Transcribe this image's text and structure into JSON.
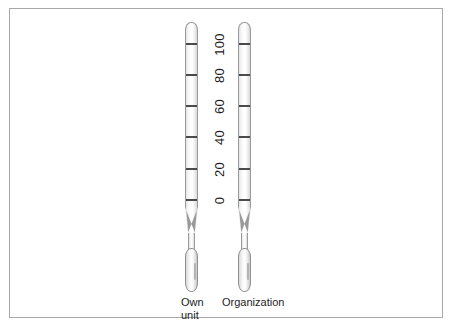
{
  "figure": {
    "background_color": "#ffffff",
    "frame_color": "#a8a8a8",
    "tick_color": "#4a4a4a",
    "text_color": "#1d1d1d"
  },
  "scale": {
    "labels": [
      "100",
      "80",
      "60",
      "40",
      "20",
      "0"
    ],
    "values": [
      100,
      80,
      60,
      40,
      20,
      0
    ],
    "tick_count": 6,
    "orientation": "vertical",
    "label_rotation_deg": -90
  },
  "thermometers": [
    {
      "id": "own-unit",
      "caption": "Own\nunit",
      "caption_line1": "Own",
      "caption_line2": "unit"
    },
    {
      "id": "organization",
      "caption": "Organization",
      "caption_line1": "Organization",
      "caption_line2": ""
    }
  ]
}
